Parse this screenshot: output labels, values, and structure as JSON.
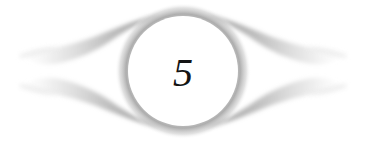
{
  "page": {
    "kind": "chapter-opener-ornament",
    "background_color": "#ffffff",
    "width": 366,
    "height": 142
  },
  "ornament": {
    "name": "eye-flourish-ornament",
    "description": "Symmetrical winged flourish surrounding a circular medallion",
    "wing_color": "#9a9a9a",
    "wing_tip_color": "#d8d8d8",
    "wing_count": 4,
    "wings": [
      {
        "name": "wing-upper-left",
        "position": "upper-left"
      },
      {
        "name": "wing-lower-left",
        "position": "lower-left"
      },
      {
        "name": "wing-upper-right",
        "position": "upper-right"
      },
      {
        "name": "wing-lower-right",
        "position": "lower-right"
      }
    ]
  },
  "medallion": {
    "name": "chapter-number-medallion",
    "fill_color": "#ffffff",
    "halo_color": "#8e8e8e",
    "center_x": 183,
    "center_y": 71,
    "radius": 55
  },
  "chapter": {
    "number": "5",
    "numeral_color": "#141414"
  }
}
